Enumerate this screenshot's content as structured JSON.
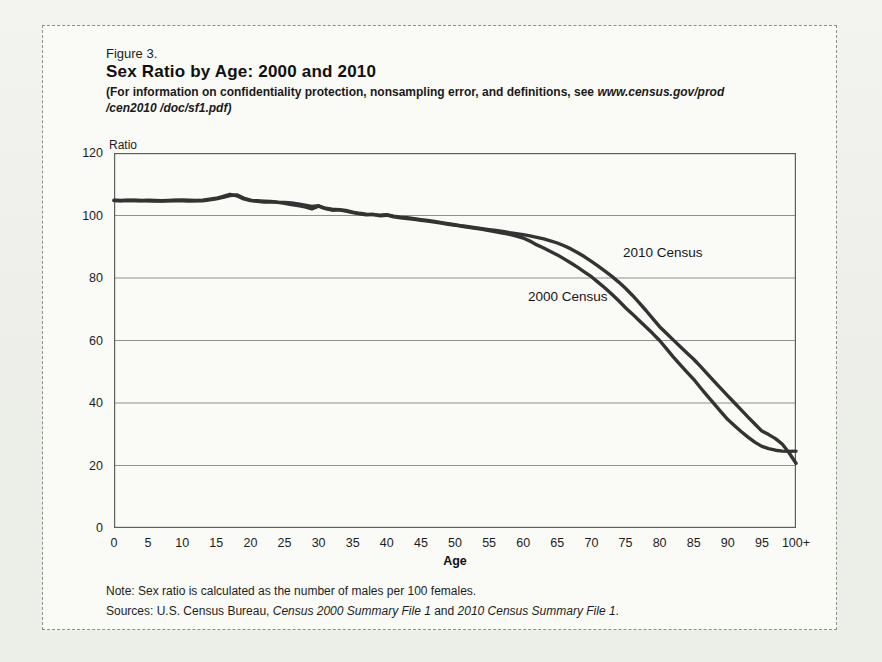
{
  "figure": {
    "label": "Figure 3.",
    "title": "Sex Ratio by Age: 2000 and 2010",
    "subtitle_prefix": "(For information on confidentiality protection, nonsampling error, and definitions, see ",
    "subtitle_url_line1": "www.census.gov/prod",
    "subtitle_url_line2": "/cen2010 /doc/sf1.pdf)"
  },
  "chart_data": {
    "type": "line",
    "title": "Sex Ratio by Age: 2000 and 2010",
    "xlabel": "Age",
    "ylabel": "Ratio",
    "xlim": [
      0,
      100
    ],
    "ylim": [
      0,
      120
    ],
    "grid": "horizontal",
    "gridlines_at": [
      20,
      40,
      60,
      80,
      100
    ],
    "y_ticks": [
      0,
      20,
      40,
      60,
      80,
      100,
      120
    ],
    "x_tick_positions": [
      0,
      5,
      10,
      15,
      20,
      25,
      30,
      35,
      40,
      45,
      50,
      55,
      60,
      65,
      70,
      75,
      80,
      85,
      90,
      95,
      100
    ],
    "x_tick_labels": [
      "0",
      "5",
      "10",
      "15",
      "20",
      "25",
      "30",
      "35",
      "40",
      "45",
      "50",
      "55",
      "60",
      "65",
      "70",
      "75",
      "80",
      "85",
      "90",
      "95",
      "100+"
    ],
    "ages": [
      0,
      1,
      2,
      3,
      4,
      5,
      6,
      7,
      8,
      9,
      10,
      11,
      12,
      13,
      14,
      15,
      16,
      17,
      18,
      19,
      20,
      21,
      22,
      23,
      24,
      25,
      26,
      27,
      28,
      29,
      30,
      31,
      32,
      33,
      34,
      35,
      36,
      37,
      38,
      39,
      40,
      41,
      42,
      43,
      44,
      45,
      46,
      47,
      48,
      49,
      50,
      51,
      52,
      53,
      54,
      55,
      56,
      57,
      58,
      59,
      60,
      61,
      62,
      63,
      64,
      65,
      66,
      67,
      68,
      69,
      70,
      71,
      72,
      73,
      74,
      75,
      76,
      77,
      78,
      79,
      80,
      81,
      82,
      83,
      84,
      85,
      86,
      87,
      88,
      89,
      90,
      91,
      92,
      93,
      94,
      95,
      96,
      97,
      98,
      99,
      100
    ],
    "series": [
      {
        "name": "2000 Census",
        "values": [
          104.8,
          104.7,
          104.9,
          104.8,
          104.7,
          104.9,
          104.8,
          104.7,
          104.8,
          104.9,
          105.0,
          104.9,
          104.8,
          104.7,
          105.0,
          105.3,
          105.8,
          106.4,
          106.6,
          105.6,
          104.9,
          104.5,
          104.3,
          104.4,
          104.2,
          103.9,
          103.5,
          103.2,
          102.8,
          102.1,
          103.0,
          102.2,
          101.7,
          101.8,
          101.4,
          100.9,
          100.5,
          100.2,
          100.4,
          99.9,
          100.1,
          99.6,
          99.3,
          99.0,
          98.8,
          98.5,
          98.2,
          97.9,
          97.6,
          97.2,
          96.9,
          96.5,
          96.2,
          95.9,
          95.6,
          95.2,
          94.8,
          94.4,
          94.0,
          93.4,
          92.8,
          91.8,
          90.6,
          89.6,
          88.5,
          87.4,
          86.1,
          84.8,
          83.4,
          81.9,
          80.4,
          78.6,
          76.8,
          74.8,
          72.7,
          70.5,
          68.5,
          66.4,
          64.3,
          62.2,
          60.0,
          57.4,
          54.8,
          52.3,
          49.9,
          47.6,
          44.9,
          42.3,
          39.7,
          37.2,
          34.7,
          32.7,
          30.8,
          29.0,
          27.4,
          26.1,
          25.4,
          24.9,
          24.6,
          24.5,
          24.6
        ]
      },
      {
        "name": "2010 Census",
        "values": [
          104.9,
          104.8,
          104.8,
          104.9,
          104.8,
          104.7,
          104.6,
          104.6,
          104.7,
          104.8,
          104.7,
          104.6,
          104.7,
          104.9,
          105.2,
          105.5,
          106.1,
          106.8,
          106.3,
          105.3,
          104.8,
          104.7,
          104.6,
          104.5,
          104.3,
          104.2,
          104.0,
          103.7,
          103.3,
          102.9,
          103.1,
          102.3,
          102.0,
          101.9,
          101.6,
          101.1,
          100.7,
          100.4,
          100.3,
          100.1,
          100.3,
          99.8,
          99.5,
          99.3,
          99.0,
          98.7,
          98.4,
          98.1,
          97.7,
          97.4,
          97.1,
          96.7,
          96.4,
          96.1,
          95.8,
          95.5,
          95.2,
          94.9,
          94.5,
          94.2,
          93.9,
          93.5,
          93.0,
          92.5,
          91.9,
          91.2,
          90.3,
          89.3,
          88.1,
          86.8,
          85.3,
          83.8,
          82.2,
          80.5,
          78.7,
          76.7,
          74.5,
          72.1,
          69.6,
          67.0,
          64.4,
          62.3,
          60.2,
          58.1,
          56.0,
          54.0,
          51.7,
          49.3,
          46.9,
          44.6,
          42.3,
          40.0,
          37.7,
          35.4,
          33.2,
          31.0,
          29.9,
          28.6,
          26.8,
          24.0,
          20.7
        ]
      }
    ],
    "annotations": [
      {
        "text": "2010 Census",
        "x": 80,
        "y": 88
      },
      {
        "text": "2000 Census",
        "x": 66,
        "y": 74
      }
    ]
  },
  "notes": {
    "note": "Note: Sex ratio is calculated as the number of males per 100 females.",
    "sources_prefix": "Sources: U.S. Census Bureau, ",
    "source_1": "Census 2000 Summary File 1",
    "sources_joiner": " and ",
    "source_2": "2010 Census Summary File 1",
    "sources_suffix": "."
  }
}
